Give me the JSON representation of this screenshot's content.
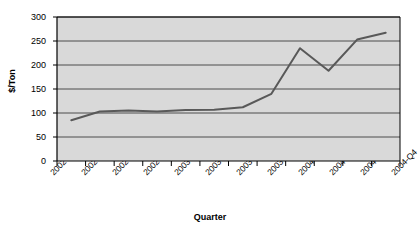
{
  "chart_data": {
    "type": "line",
    "title": "",
    "xlabel": "Quarter",
    "ylabel": "$/Ton",
    "categories": [
      "2002-Q1",
      "2002-Q2",
      "2002-Q3",
      "2002-Q4",
      "2003-Q1",
      "2003-Q2",
      "2003-Q3",
      "2003-Q4",
      "2004-Q1",
      "2004-Q2",
      "2004-Q3",
      "2004-Q4"
    ],
    "values": [
      85,
      103,
      105,
      103,
      106,
      107,
      112,
      140,
      235,
      188,
      253,
      267
    ],
    "series": [
      {
        "name": "Price",
        "values": [
          85,
          103,
          105,
          103,
          106,
          107,
          112,
          140,
          235,
          188,
          253,
          267
        ]
      }
    ],
    "ylim": [
      0,
      300
    ],
    "ytick_labels": [
      "0",
      "50",
      "100",
      "150",
      "200",
      "250",
      "300"
    ],
    "ytick_values": [
      0,
      50,
      100,
      150,
      200,
      250,
      300
    ],
    "grid": true,
    "grid_axis": "y",
    "legend": false,
    "legend_position": "none",
    "plot_background": "#d9d9d9",
    "line_color": "#595959",
    "grid_color": "#4d4d4d",
    "axis_color": "#000000",
    "page_background": "#ffffff"
  }
}
